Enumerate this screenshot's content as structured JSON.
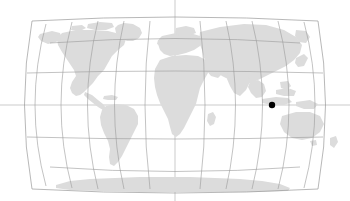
{
  "map": {
    "type": "world-map",
    "projection": "robinson",
    "title": "",
    "background_color": "#ffffff",
    "land_color": "#dcdcdc",
    "graticule_color": "#9a9a9a",
    "ocean_color": "#ffffff",
    "marker_color": "#000000",
    "width": 350,
    "height": 201,
    "graticule": {
      "visible": true,
      "meridian_interval_deg": 30,
      "parallel_interval_deg": 30,
      "meridians_deg": [
        -180,
        -150,
        -120,
        -90,
        -60,
        -30,
        0,
        30,
        60,
        90,
        120,
        150,
        180
      ],
      "parallels_deg": [
        60,
        30,
        0,
        -30,
        -60
      ],
      "central_meridian_deg": 0,
      "equator_label": "0",
      "axis_lines_extend_full_canvas": true
    },
    "markers": [
      {
        "name": "location-marker",
        "label": "",
        "longitude_deg": 120,
        "latitude_deg": 0,
        "x_px": 272,
        "y_px": 105,
        "radius_px": 3.2,
        "color": "#000000"
      }
    ],
    "landmasses": [
      "North America",
      "South America",
      "Europe",
      "Africa",
      "Asia",
      "Australia",
      "Antarctica",
      "Greenland"
    ]
  },
  "chart_data": {
    "type": "map",
    "title": "",
    "xlabel": "Longitude",
    "ylabel": "Latitude",
    "xlim": [
      -180,
      180
    ],
    "ylim": [
      -90,
      90
    ],
    "grid": true,
    "legend": "none",
    "points": [
      {
        "label": "",
        "longitude": 120,
        "latitude": 0
      }
    ]
  }
}
